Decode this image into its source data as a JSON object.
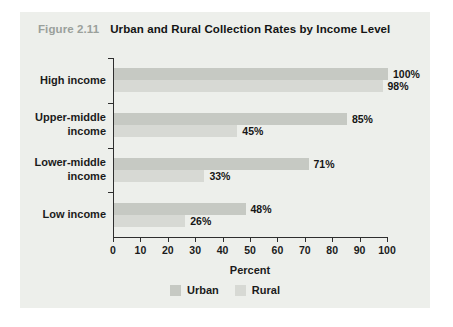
{
  "figure": {
    "label": "Figure 2.11",
    "title": "Urban and Rural Collection Rates by Income Level",
    "label_color": "#9aa09b"
  },
  "chart_data": {
    "type": "bar",
    "orientation": "horizontal",
    "title": "Urban and Rural Collection Rates by Income Level",
    "categories": [
      "High income",
      "Upper-middle income",
      "Lower-middle income",
      "Low income"
    ],
    "series": [
      {
        "name": "Urban",
        "values": [
          100,
          85,
          71,
          48
        ],
        "color": "#c6c9c3"
      },
      {
        "name": "Rural",
        "values": [
          98,
          45,
          33,
          26
        ],
        "color": "#d7d9d4"
      }
    ],
    "value_labels": [
      [
        "100%",
        "85%",
        "71%",
        "48%"
      ],
      [
        "98%",
        "45%",
        "33%",
        "26%"
      ]
    ],
    "xlabel": "Percent",
    "xlim": [
      0,
      100
    ],
    "xticks": [
      "0",
      "10",
      "20",
      "30",
      "40",
      "50",
      "60",
      "70",
      "80",
      "90",
      "100"
    ],
    "grid": false,
    "legend_position": "bottom",
    "legend": [
      "Urban",
      "Rural"
    ],
    "axis_color": "#2e2e2e",
    "panel_background": "#edefeb"
  }
}
